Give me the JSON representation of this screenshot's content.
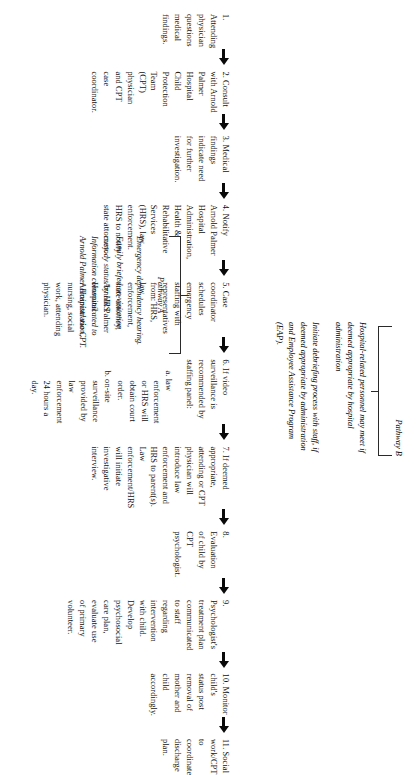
{
  "document": {
    "type": "flowchart",
    "orientation": "rotated-90",
    "title_visible": false
  },
  "flow": {
    "steps": [
      {
        "number": "1.",
        "text": "1. Attending physician questions medical findings."
      },
      {
        "number": "2.",
        "text": "2. Consult with Arnold Palmer Hospital Child Protection Team (CPT) physician and CPT case coordinator."
      },
      {
        "number": "3.",
        "text": "3. Medical findings indicate need for further investigation."
      },
      {
        "number": "4.",
        "text": "4. Notify Arnold Palmer Hospital Administration, Health & Rehabilitative Services (HRS), law enforcement. HRS to notify state attorney."
      },
      {
        "number": "5.",
        "text": "5. Case coordinator schedules emergency staffing with representatives from: HRS, law enforcement, state attorney, Arnold Palmer Hospital Administration, nursing, social work, attending physician."
      },
      {
        "number": "6.",
        "text": "6. If video surveillance is recommended by staffing panel:",
        "subitems": [
          "a.  law enforcement or HRS will obtain court order.",
          "b.  on-site surveillance provided by law enforcement 24 hours a day."
        ]
      },
      {
        "number": "7.",
        "text": "7. If deemed appropriate, attending or CPT physician will introduce law enforcement and HRS to parent(s). Law enforcement/HRS will initiate investigative interview."
      },
      {
        "number": "8.",
        "text": "8. Evaluation of child by CPT psychologist."
      },
      {
        "number": "9.",
        "text": "9. Psychologist's treatment plan communicated to staff regarding intervention with child. Develop psychosocial care plan, evaluate use of primary volunteer."
      },
      {
        "number": "10.",
        "text": "10. Monitor child's status post removal of mother and child accordingly."
      },
      {
        "number": "11.",
        "text": "11. Social work/CPT to coordinate discharge plan."
      }
    ],
    "arrow_count": 10,
    "arrow_color": "#0a0a0a"
  },
  "pathways": {
    "a": {
      "label": "Pathway A",
      "notes": [
        "Emergency dependency hearing.",
        "Family briefed on visitation custody status by HRS. Information communicated to Arnold Palmer Hospital via CPT."
      ]
    },
    "b": {
      "label": "Pathway B",
      "notes": [
        "Hospital-related personnel may meet if deemed appropriate by hospital administration",
        "Initiate debriefing process with staff, if deemed appropriate by administration and Employee Assistance Program (EAP)."
      ]
    }
  },
  "style": {
    "background": "#ffffff",
    "text_color": "#111111",
    "rule_color": "#2a2a2a"
  }
}
